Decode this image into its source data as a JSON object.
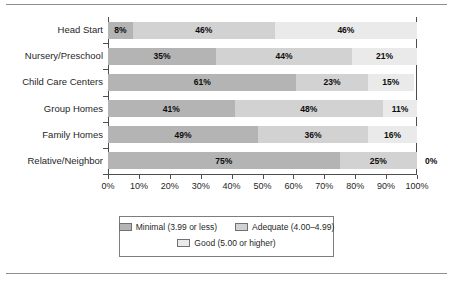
{
  "chart_data": {
    "type": "bar",
    "orientation": "horizontal",
    "stacked": true,
    "stack_normalized_percent": true,
    "title": "",
    "subtitle": "",
    "xlabel": "",
    "ylabel": "",
    "xlim": [
      0,
      100
    ],
    "xtick_labels": [
      "0%",
      "10%",
      "20%",
      "30%",
      "40%",
      "50%",
      "60%",
      "70%",
      "80%",
      "90%",
      "100%"
    ],
    "xtick_values": [
      0,
      10,
      20,
      30,
      40,
      50,
      60,
      70,
      80,
      90,
      100
    ],
    "grid": false,
    "legend_position": "bottom",
    "categories": [
      "Head Start",
      "Nursery/Preschool",
      "Child Care Centers",
      "Group Homes",
      "Family Homes",
      "Relative/Neighbor"
    ],
    "series": [
      {
        "name": "Minimal (3.99 or less)",
        "color": "#b4b4b4",
        "values": [
          8,
          35,
          61,
          41,
          49,
          75
        ],
        "labels": [
          "8%",
          "35%",
          "61%",
          "41%",
          "49%",
          "75%"
        ]
      },
      {
        "name": "Adequate (4.00–4.99)",
        "color": "#d2d2d2",
        "values": [
          46,
          44,
          23,
          48,
          36,
          25
        ],
        "labels": [
          "46%",
          "44%",
          "23%",
          "48%",
          "36%",
          "25%"
        ]
      },
      {
        "name": "Good (5.00 or higher)",
        "color": "#eaeaea",
        "values": [
          46,
          21,
          15,
          11,
          16,
          0
        ],
        "labels": [
          "46%",
          "21%",
          "15%",
          "11%",
          "16%",
          "0%"
        ]
      }
    ],
    "outside_labels": [
      {
        "text": "0%",
        "category": "Relative/Neighbor",
        "series": "Good (5.00 or higher)"
      }
    ]
  },
  "legend": {
    "items": [
      {
        "label": "Minimal (3.99 or less)",
        "swatch": "s0"
      },
      {
        "label": "Adequate (4.00–4.99)",
        "swatch": "s1"
      },
      {
        "label": "Good (5.00 or higher)",
        "swatch": "s2"
      }
    ]
  }
}
